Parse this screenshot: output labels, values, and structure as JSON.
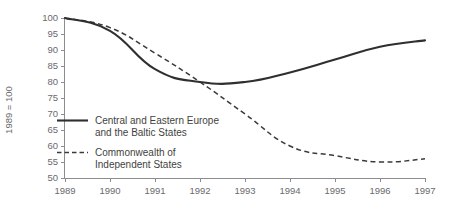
{
  "chart_data": {
    "type": "line",
    "title": "",
    "xlabel": "",
    "ylabel": "1989 = 100",
    "x": [
      1989,
      1990,
      1991,
      1992,
      1993,
      1994,
      1995,
      1996,
      1997
    ],
    "xtick_labels": [
      "1989",
      "1990",
      "1991",
      "1992",
      "1993",
      "1994",
      "1995",
      "1996",
      "1997"
    ],
    "ytick_labels": [
      "50",
      "55",
      "60",
      "65",
      "70",
      "75",
      "80",
      "85",
      "90",
      "95",
      "100"
    ],
    "yticks": [
      50,
      55,
      60,
      65,
      70,
      75,
      80,
      85,
      90,
      95,
      100
    ],
    "ylim": [
      50,
      100
    ],
    "xlim": [
      1989,
      1997
    ],
    "grid": false,
    "legend_position": "inner-left",
    "series": [
      {
        "name": "Central and Eastern Europe and the Baltic States",
        "legend_line1": "Central and Eastern Europe",
        "legend_line2": "and the Baltic States",
        "style": "solid",
        "color": "#2f2f31",
        "values": [
          100,
          96,
          84,
          80,
          80,
          83,
          87,
          91,
          93
        ]
      },
      {
        "name": "Commonwealth of Independent States",
        "legend_line1": "Commonwealth of",
        "legend_line2": "Independent States",
        "style": "dashed",
        "color": "#3a3a3c",
        "values": [
          100,
          97,
          89,
          80,
          70,
          60,
          57,
          55,
          56
        ]
      }
    ]
  },
  "axis": {
    "y_title": "1989 = 100"
  },
  "colors": {
    "axis": "#8d8d8f",
    "tick_text": "#6a6a6c",
    "legend_text": "#3f3f41",
    "background": "#ffffff"
  }
}
